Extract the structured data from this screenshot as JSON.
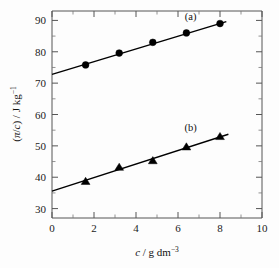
{
  "chart_data": {
    "type": "scatter",
    "title": "",
    "xlabel": "c / g dm−3",
    "ylabel": "(π/c) / J kg−1",
    "xlim": [
      0,
      10
    ],
    "ylim": [
      27,
      93
    ],
    "grid": false,
    "legend_position": "inline-annotation",
    "x_ticks": [
      0,
      2,
      4,
      6,
      8,
      10
    ],
    "x_tick_labels": [
      "0",
      "2",
      "4",
      "6",
      "8",
      "10"
    ],
    "x_minor_ticks": [
      1,
      3,
      5,
      7,
      9
    ],
    "y_ticks": [
      30,
      40,
      50,
      60,
      70,
      80,
      90
    ],
    "y_tick_labels": [
      "30",
      "40",
      "50",
      "60",
      "70",
      "80",
      "90"
    ],
    "y_minor_ticks": [
      35,
      45,
      55,
      65,
      75,
      85
    ],
    "series": [
      {
        "name": "(a)",
        "marker": "circle",
        "label_x": 6.6,
        "label_y": 90.0,
        "x": [
          1.6,
          3.2,
          4.8,
          6.4,
          8.0
        ],
        "y": [
          75.8,
          79.6,
          83.0,
          86.0,
          89.0
        ],
        "fit_line": {
          "x0": 0.0,
          "y0": 72.8,
          "x1": 8.3,
          "y1": 89.6
        }
      },
      {
        "name": "(b)",
        "marker": "triangle",
        "label_x": 6.6,
        "label_y": 54.8,
        "x": [
          1.6,
          3.2,
          4.8,
          6.4,
          8.0
        ],
        "y": [
          38.7,
          43.2,
          45.3,
          49.7,
          53.0
        ],
        "fit_line": {
          "x0": 0.0,
          "y0": 35.6,
          "x1": 8.4,
          "y1": 53.7
        }
      }
    ]
  },
  "axis_text": {
    "y_title_parts": {
      "open": "(",
      "pi": "π",
      "slash1": "/",
      "c": "c",
      "close": ") / J kg",
      "exp": "−1"
    },
    "x_title_parts": {
      "c": "c",
      "rest": " / g dm",
      "exp": "−3"
    }
  }
}
